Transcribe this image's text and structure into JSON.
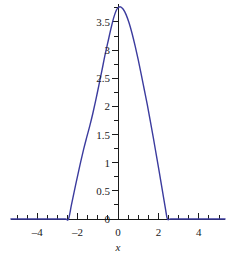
{
  "chart_data": {
    "type": "line",
    "title": "",
    "subtitle": "",
    "xlabel": "x",
    "ylabel": "",
    "xlim": [
      -5.3,
      5.3
    ],
    "ylim": [
      0,
      3.82
    ],
    "grid": false,
    "legend": null,
    "series": [
      {
        "name": "curve",
        "color": "#3b3b9e",
        "line_width": 1.4,
        "x": [
          -5.3,
          -4.5,
          -4.0,
          -3.5,
          -3.0,
          -2.6,
          -2.45,
          -2.3,
          -2.1,
          -1.9,
          -1.7,
          -1.55,
          -1.4,
          -1.25,
          -1.1,
          -0.95,
          -0.8,
          -0.65,
          -0.5,
          -0.35,
          -0.2,
          -0.05,
          0.1,
          0.25,
          0.4,
          0.55,
          0.7,
          0.85,
          1.0,
          1.15,
          1.3,
          1.45,
          1.6,
          1.75,
          1.9,
          2.05,
          2.2,
          2.35,
          2.45,
          2.6,
          3.0,
          3.5,
          4.0,
          4.5,
          5.3
        ],
        "y": [
          0,
          0,
          0,
          0,
          0,
          0,
          0,
          0.26,
          0.6,
          0.93,
          1.24,
          1.45,
          1.65,
          1.87,
          2.11,
          2.37,
          2.63,
          2.9,
          3.14,
          3.38,
          3.59,
          3.73,
          3.77,
          3.73,
          3.63,
          3.48,
          3.29,
          3.07,
          2.83,
          2.57,
          2.3,
          2.03,
          1.74,
          1.44,
          1.13,
          0.82,
          0.5,
          0.18,
          0,
          0,
          0,
          0,
          0,
          0,
          0
        ]
      }
    ],
    "x_axis": {
      "major_ticks": [
        -4,
        -2,
        0,
        2,
        4
      ],
      "major_tick_labels": [
        "-4",
        "-2",
        "0",
        "2",
        "4"
      ],
      "minor_tick_step": 0.5,
      "axis_color": "#1a1a1a"
    },
    "y_axis": {
      "major_ticks": [
        0,
        0.5,
        1,
        1.5,
        2,
        2.5,
        3,
        3.5
      ],
      "major_tick_labels": [
        "0",
        "0.5",
        "1",
        "1.5",
        "2",
        "2.5",
        "3",
        "3.5"
      ],
      "minor_tick_step": 0.25,
      "axis_color": "#1a1a1a"
    },
    "annotations": [],
    "peak": {
      "x": 0.1,
      "y": 3.77
    },
    "zero_crossings": [
      -2.45,
      2.45
    ],
    "background_color": "#ffffff"
  }
}
